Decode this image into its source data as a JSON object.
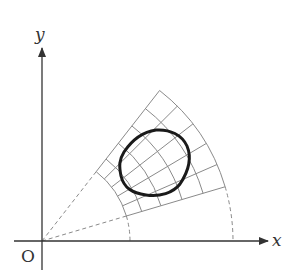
{
  "diagram": {
    "type": "polar-coordinate-grid-with-closed-region",
    "labels": {
      "x_axis": "x",
      "y_axis": "y",
      "origin": "O"
    },
    "geometry": {
      "origin_px": [
        42,
        241
      ],
      "x_axis_end_px": [
        268,
        241
      ],
      "y_axis_end_px": [
        42,
        48
      ],
      "radii_px": [
        88,
        104,
        124,
        146,
        168,
        191
      ],
      "angles_deg": [
        16.5,
        23.6,
        30.7,
        37.8,
        44.9,
        52.0
      ],
      "dashed_rays": true,
      "dashed_drops_to_x_axis": true
    },
    "region": {
      "description": "closed curve drawn over the polar grid",
      "stroke_width": 3
    },
    "colors": {
      "axis": "#333333",
      "grid": "#8a8a8a",
      "dashed": "#8a8a8a",
      "curve": "#1a1a1a",
      "background": "#ffffff"
    }
  }
}
